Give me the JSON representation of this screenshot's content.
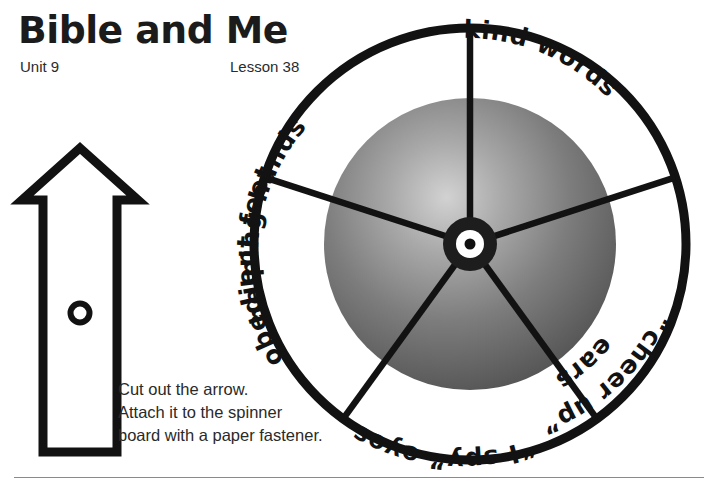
{
  "header": {
    "title": "Bible and Me",
    "unit": "Unit 9",
    "lesson": "Lesson 38"
  },
  "instructions": {
    "line1": "Cut out the arrow.",
    "line2": "Attach it to the spinner",
    "line3": "board with a paper fastener."
  },
  "arrow": {
    "name": "spinner-arrow",
    "hole_label": ""
  },
  "spinner": {
    "name": "spinner-board",
    "center": {
      "x": 470,
      "y": 244
    },
    "outer_radius": 221,
    "gradient_radius": 146,
    "hub_radius": 27,
    "segments": [
      {
        "id": "helping-hands",
        "label": "helping hands",
        "start_angle": 90,
        "end_angle": 162
      },
      {
        "id": "kind-words",
        "label": "kind words",
        "start_angle": 18,
        "end_angle": 90
      },
      {
        "id": "cheer-up-ears",
        "label": "“cheer up” ears",
        "line1": "“cheer up”",
        "line2": "ears",
        "start_angle": -54,
        "end_angle": 18
      },
      {
        "id": "i-spy-eyes",
        "label": "“I spy” eyes",
        "start_angle": -126,
        "end_angle": -54
      },
      {
        "id": "obedient-feet",
        "label": "obedient feet",
        "start_angle": 162,
        "end_angle": 234
      }
    ]
  },
  "colors": {
    "ink": "#121212",
    "rule": "#8a8a8a",
    "gradient_outer": "#b9b9b9",
    "gradient_inner": "#585858",
    "paper": "#ffffff"
  }
}
